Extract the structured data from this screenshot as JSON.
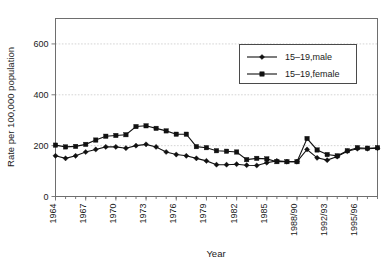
{
  "chart_data": {
    "type": "line",
    "title": "",
    "xlabel": "Year",
    "ylabel": "Rate per 100,000 population",
    "xlim": [
      1964,
      1996
    ],
    "ylim": [
      0,
      700
    ],
    "yticks": [
      0,
      200,
      400,
      600
    ],
    "ytick_labels": [
      "0",
      "200",
      "400",
      "600"
    ],
    "xticks": [
      1964,
      1967,
      1970,
      1973,
      1976,
      1979,
      1982,
      1985,
      1988,
      1991,
      1994
    ],
    "xtick_labels": [
      "1964",
      "1967",
      "1970",
      "1973",
      "1976",
      "1979",
      "1982",
      "1985",
      "1988/90",
      "1992/93",
      "1995/96"
    ],
    "grid": "horizontal-dotted",
    "legend_position": "top-right",
    "x": [
      1964,
      1965,
      1966,
      1967,
      1968,
      1969,
      1970,
      1971,
      1972,
      1973,
      1974,
      1975,
      1976,
      1977,
      1978,
      1979,
      1980,
      1981,
      1982,
      1983,
      1984,
      1985,
      1986,
      1987,
      1988,
      1989,
      1990,
      1991,
      1992,
      1993,
      1994,
      1995,
      1996
    ],
    "series": [
      {
        "name": "15–19,male",
        "marker": "diamond",
        "color": "#111111",
        "values": [
          160,
          150,
          160,
          175,
          185,
          195,
          195,
          190,
          200,
          205,
          195,
          175,
          165,
          160,
          150,
          140,
          125,
          125,
          127,
          123,
          122,
          133,
          140,
          137,
          137,
          185,
          152,
          143,
          157,
          178,
          188,
          188,
          190
        ]
      },
      {
        "name": "15–19,female",
        "marker": "square",
        "color": "#111111",
        "values": [
          202,
          195,
          197,
          205,
          222,
          237,
          240,
          243,
          275,
          278,
          268,
          258,
          245,
          245,
          196,
          192,
          180,
          178,
          175,
          145,
          150,
          148,
          137,
          137,
          137,
          228,
          183,
          165,
          160,
          180,
          192,
          190,
          192
        ]
      }
    ],
    "annotations": []
  },
  "legend": {
    "entries": [
      {
        "label": "15–19,male",
        "marker": "diamond"
      },
      {
        "label": "15–19,female",
        "marker": "square"
      }
    ]
  }
}
